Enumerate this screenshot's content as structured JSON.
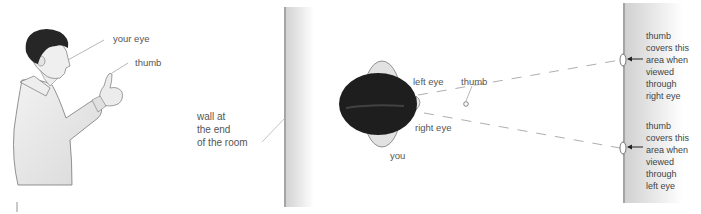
{
  "figure_left": {
    "labels": {
      "your_eye": "your eye",
      "thumb": "thumb"
    }
  },
  "figure_right": {
    "labels": {
      "wall": "wall at\nthe end\nof the room",
      "left_eye": "left eye",
      "right_eye": "right eye",
      "thumb": "thumb",
      "you": "you",
      "area_right_eye": "thumb\ncovers this\narea when\nviewed\nthrough\nright eye",
      "area_left_eye": "thumb\ncovers this\narea when\nviewed\nthrough\nleft eye"
    }
  },
  "colors": {
    "text": "#555555",
    "line": "#9a9a9a",
    "hair": "#1f1f1f",
    "skin": "#e6e6e6",
    "wall": "#d6d6d6"
  }
}
